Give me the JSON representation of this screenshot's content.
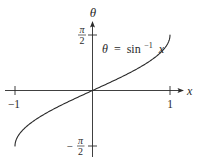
{
  "chart_data": {
    "type": "line",
    "title": "",
    "function_label": {
      "lhs": "θ",
      "equals": "=",
      "fn": "sin",
      "superscript": "−1",
      "arg": "x"
    },
    "xlabel": "x",
    "ylabel": "θ",
    "xlim": [
      -1,
      1
    ],
    "ylim": [
      -1.5708,
      1.5708
    ],
    "x_ticks": [
      {
        "value": -1,
        "label": "−1"
      },
      {
        "value": 1,
        "label": "1"
      }
    ],
    "y_ticks": [
      {
        "value": 1.5708,
        "sign": "",
        "numerator": "π",
        "denominator": "2"
      },
      {
        "value": -1.5708,
        "sign": "−",
        "numerator": "π",
        "denominator": "2"
      }
    ],
    "grid": false,
    "legend": "none",
    "series": [
      {
        "name": "θ = sin⁻¹ x",
        "x": [
          -1,
          -0.98,
          -0.95,
          -0.9,
          -0.8,
          -0.7,
          -0.6,
          -0.5,
          -0.4,
          -0.3,
          -0.2,
          -0.1,
          0,
          0.1,
          0.2,
          0.3,
          0.4,
          0.5,
          0.6,
          0.7,
          0.8,
          0.9,
          0.95,
          0.98,
          1
        ],
        "y": [
          -1.5708,
          -1.3694,
          -1.2532,
          -1.1198,
          -0.9273,
          -0.7754,
          -0.6435,
          -0.5236,
          -0.4115,
          -0.3047,
          -0.2014,
          -0.1002,
          0,
          0.1002,
          0.2014,
          0.3047,
          0.4115,
          0.5236,
          0.6435,
          0.7754,
          0.9273,
          1.1198,
          1.2532,
          1.3694,
          1.5708
        ]
      }
    ],
    "colors": {
      "line": "#2a2a2a",
      "axis": "#2a2a2a",
      "background": "#ffffff"
    }
  }
}
